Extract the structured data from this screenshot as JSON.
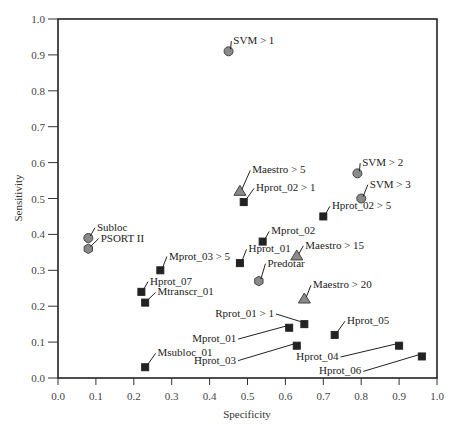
{
  "chart_data": {
    "type": "scatter",
    "title": "",
    "xlabel": "Specificity",
    "ylabel": "Sensitivity",
    "xlim": [
      0.0,
      1.0
    ],
    "ylim": [
      0.0,
      1.0
    ],
    "xticks": [
      "0.0",
      "0.1",
      "0.2",
      "0.3",
      "0.4",
      "0.5",
      "0.6",
      "0.7",
      "0.8",
      "0.9",
      "1.0"
    ],
    "yticks": [
      "0.0",
      "0.1",
      "0.2",
      "0.3",
      "0.4",
      "0.5",
      "0.6",
      "0.7",
      "0.8",
      "0.9",
      "1.0"
    ],
    "grid": false,
    "legend": null,
    "marker_styles": {
      "circle": {
        "fill": "#8a8a8a",
        "stroke": "#444444"
      },
      "square": {
        "fill": "#222222",
        "stroke": "#222222"
      },
      "triangle": {
        "fill": "#8a8a8a",
        "stroke": "#444444"
      },
      "hexagon": {
        "fill": "#8a8a8a",
        "stroke": "#444444"
      }
    },
    "points": [
      {
        "label": "SVM > 1",
        "x": 0.45,
        "y": 0.91,
        "marker": "circle",
        "lx": 0.46,
        "ly": 0.93
      },
      {
        "label": "SVM > 2",
        "x": 0.79,
        "y": 0.57,
        "marker": "circle",
        "lx": 0.8,
        "ly": 0.59
      },
      {
        "label": "SVM > 3",
        "x": 0.8,
        "y": 0.5,
        "marker": "circle",
        "lx": 0.82,
        "ly": 0.53
      },
      {
        "label": "Maestro > 5",
        "x": 0.48,
        "y": 0.52,
        "marker": "triangle",
        "lx": 0.51,
        "ly": 0.57
      },
      {
        "label": "Hprot_02 > 1",
        "x": 0.49,
        "y": 0.49,
        "marker": "square",
        "lx": 0.52,
        "ly": 0.52
      },
      {
        "label": "Hprot_02 > 5",
        "x": 0.7,
        "y": 0.45,
        "marker": "square",
        "lx": 0.72,
        "ly": 0.47
      },
      {
        "label": "Mprot_02",
        "x": 0.54,
        "y": 0.38,
        "marker": "square",
        "lx": 0.56,
        "ly": 0.4
      },
      {
        "label": "Hprot_01",
        "x": 0.48,
        "y": 0.32,
        "marker": "square",
        "lx": 0.5,
        "ly": 0.35
      },
      {
        "label": "Maestro > 15",
        "x": 0.63,
        "y": 0.34,
        "marker": "triangle",
        "lx": 0.65,
        "ly": 0.36
      },
      {
        "label": "Predotar",
        "x": 0.53,
        "y": 0.27,
        "marker": "hexagon",
        "lx": 0.55,
        "ly": 0.31
      },
      {
        "label": "Maestro > 20",
        "x": 0.65,
        "y": 0.22,
        "marker": "triangle",
        "lx": 0.67,
        "ly": 0.25
      },
      {
        "label": "Subloc",
        "x": 0.08,
        "y": 0.39,
        "marker": "circle",
        "lx": 0.1,
        "ly": 0.41
      },
      {
        "label": "PSORT II",
        "x": 0.08,
        "y": 0.36,
        "marker": "hexagon",
        "lx": 0.11,
        "ly": 0.38
      },
      {
        "label": "Mprot_03 > 5",
        "x": 0.27,
        "y": 0.3,
        "marker": "square",
        "lx": 0.29,
        "ly": 0.33
      },
      {
        "label": "Hprot_07",
        "x": 0.22,
        "y": 0.24,
        "marker": "square",
        "lx": 0.24,
        "ly": 0.26
      },
      {
        "label": "Mtranscr_01",
        "x": 0.23,
        "y": 0.21,
        "marker": "square",
        "lx": 0.26,
        "ly": 0.23
      },
      {
        "label": "Rprot_01 > 1",
        "x": 0.65,
        "y": 0.15,
        "marker": "square",
        "lx": 0.57,
        "ly": 0.17
      },
      {
        "label": "Mprot_01",
        "x": 0.61,
        "y": 0.14,
        "marker": "square",
        "lx": 0.47,
        "ly": 0.1
      },
      {
        "label": "Hprot_05",
        "x": 0.73,
        "y": 0.12,
        "marker": "square",
        "lx": 0.76,
        "ly": 0.15
      },
      {
        "label": "Hprot_03",
        "x": 0.63,
        "y": 0.09,
        "marker": "square",
        "lx": 0.47,
        "ly": 0.04
      },
      {
        "label": "Hprot_04",
        "x": 0.9,
        "y": 0.09,
        "marker": "square",
        "lx": 0.74,
        "ly": 0.05
      },
      {
        "label": "Hprot_06",
        "x": 0.96,
        "y": 0.06,
        "marker": "square",
        "lx": 0.8,
        "ly": 0.01
      },
      {
        "label": "Msubloc_01",
        "x": 0.23,
        "y": 0.03,
        "marker": "square",
        "lx": 0.26,
        "ly": 0.06
      }
    ]
  }
}
